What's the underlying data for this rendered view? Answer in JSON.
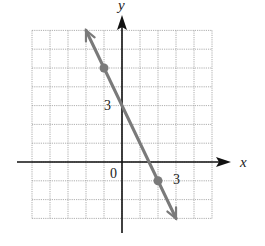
{
  "chart_data": {
    "type": "line",
    "title": "",
    "xlabel": "x",
    "ylabel": "y",
    "xlim": [
      -5,
      5
    ],
    "ylim": [
      -3,
      7
    ],
    "grid": true,
    "grid_step": 1,
    "tick_labels": {
      "origin": "0",
      "x": [
        {
          "value": 3,
          "label": "3"
        }
      ],
      "y": [
        {
          "value": 3,
          "label": "3"
        }
      ]
    },
    "series": [
      {
        "name": "line",
        "equation": "y = -2x + 3",
        "slope": -2,
        "intercept": 3,
        "x": [
          -2,
          3
        ],
        "y": [
          7,
          -3
        ],
        "arrows": "both",
        "marked_points": [
          {
            "x": -1,
            "y": 5
          },
          {
            "x": 2,
            "y": -1
          }
        ]
      }
    ],
    "colors": {
      "line": "#7a7a7a",
      "grid": "#9a9a9a",
      "axis": "#111111"
    }
  }
}
